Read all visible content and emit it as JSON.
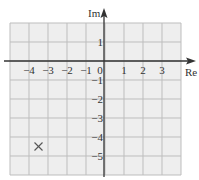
{
  "diagram": {
    "type": "argand-diagram",
    "axes": {
      "x_label": "Re",
      "y_label": "Im",
      "x_ticks": [
        "-4",
        "-3",
        "-2",
        "-1",
        "0",
        "1",
        "2",
        "3"
      ],
      "y_ticks": [
        "1",
        "-1",
        "-2",
        "-3",
        "-4",
        "-5"
      ]
    },
    "grid": {
      "x_range": [
        -5,
        4
      ],
      "y_range": [
        -6,
        2
      ],
      "step": 1
    },
    "points": [
      {
        "marker": "cross",
        "re": -3.5,
        "im": -4.5
      }
    ],
    "colors": {
      "grid_fill": "#eeeeee",
      "grid_line": "#bdbdbd",
      "axis": "#333333",
      "marker": "#555555"
    }
  }
}
